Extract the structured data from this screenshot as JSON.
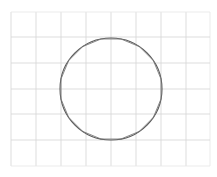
{
  "diagram": {
    "type": "grid-with-circle",
    "background_color": "#ffffff",
    "grid": {
      "x_lines": [
        11,
        36,
        61,
        86,
        111,
        136,
        161,
        186,
        210
      ],
      "y_lines": [
        12,
        37,
        63,
        89,
        114,
        140,
        166
      ],
      "line_color": "#d4d4d4"
    },
    "circle": {
      "cx": 111,
      "cy": 89,
      "r": 51,
      "stroke_color": "#5a5a5a"
    },
    "polygon_approximation": {
      "sides": 16,
      "cx": 111,
      "cy": 89,
      "r": 51,
      "stroke_color": "#7a7a7a"
    }
  }
}
